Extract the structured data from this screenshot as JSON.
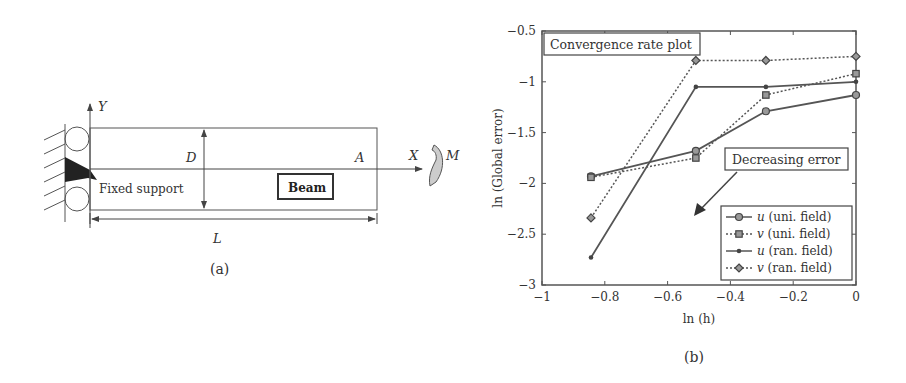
{
  "panel_a": {
    "caption": "(a)",
    "labels": {
      "y_axis": "Y",
      "x_axis": "X",
      "moment": "M",
      "depth": "D",
      "point": "A",
      "length": "L",
      "support": "Fixed support",
      "beam": "Beam"
    }
  },
  "panel_b": {
    "caption": "(b)",
    "title_box": "Convergence rate plot",
    "annotation": "Decreasing error",
    "legend": [
      {
        "sym": "u",
        "label": " (uni. field)"
      },
      {
        "sym": "v",
        "label": " (uni. field)"
      },
      {
        "sym": "u",
        "label": " (ran. field)"
      },
      {
        "sym": "v",
        "label": " (ran. field)"
      }
    ]
  },
  "chart_data": {
    "type": "line",
    "title": "Convergence rate plot",
    "xlabel": "ln (h)",
    "ylabel": "ln (Global error)",
    "xlim": [
      -1,
      0
    ],
    "ylim": [
      -3,
      -0.5
    ],
    "xticks": [
      "-1",
      "-0.8",
      "-0.6",
      "-0.4",
      "-0.2",
      "0"
    ],
    "yticks": [
      "-3",
      "-2.5",
      "-2",
      "-1.5",
      "-1",
      "-0.5"
    ],
    "grid": false,
    "legend_position": "lower right",
    "x": [
      -0.844,
      -0.51,
      -0.287,
      0
    ],
    "series": [
      {
        "name": "u (uni. field)",
        "style": "solid",
        "marker": "circle",
        "values": [
          -1.93,
          -1.68,
          -1.29,
          -1.13
        ]
      },
      {
        "name": "v (uni. field)",
        "style": "dotted",
        "marker": "square",
        "values": [
          -1.94,
          -1.75,
          -1.13,
          -0.92
        ]
      },
      {
        "name": "u (ran. field)",
        "style": "solid",
        "marker": "dot",
        "values": [
          -2.73,
          -1.05,
          -1.05,
          -1.0
        ]
      },
      {
        "name": "v (ran. field)",
        "style": "dotted",
        "marker": "diamond",
        "values": [
          -2.34,
          -0.79,
          -0.79,
          -0.75
        ]
      }
    ],
    "annotations": [
      "Decreasing error (arrow pointing lower-left)"
    ]
  }
}
